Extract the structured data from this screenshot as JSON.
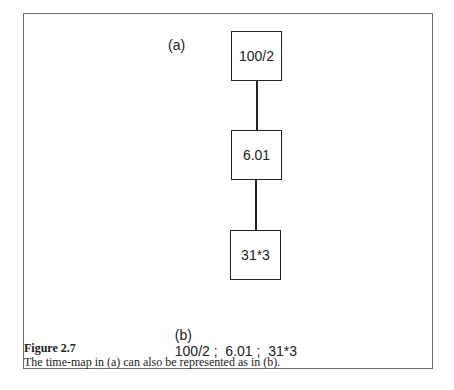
{
  "diagram": {
    "label_a": "(a)",
    "nodes": [
      {
        "id": "n1",
        "label": "100/2"
      },
      {
        "id": "n2",
        "label": "6.01"
      },
      {
        "id": "n3",
        "label": "31*3"
      }
    ],
    "edges": [
      {
        "from": "n1",
        "to": "n2"
      },
      {
        "from": "n2",
        "to": "n3"
      }
    ],
    "label_b": "(b)",
    "representation": "100/2 ;  6.01 ;  31*3"
  },
  "caption": {
    "figure_number": "Figure 2.7",
    "text": "The time-map in (a) can also be represented as in (b)."
  }
}
